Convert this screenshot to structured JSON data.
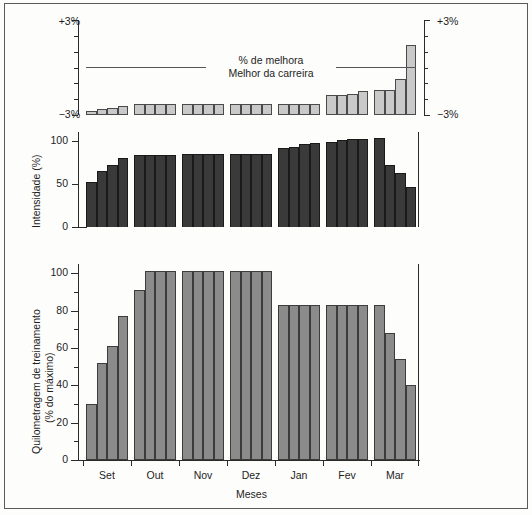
{
  "figure": {
    "background": "#fdfdfc",
    "border_color": "#5a5a5a",
    "xlabel": "Meses",
    "months": [
      "Set",
      "Out",
      "Nov",
      "Dez",
      "Jan",
      "Fev",
      "Mar"
    ]
  },
  "chart_data": [
    {
      "type": "bar",
      "id": "improvement",
      "title": "",
      "annotation_line1": "% de melhora",
      "annotation_line2": "Melhor da carreira",
      "xlabel": "",
      "ylabel": "",
      "ylim": [
        -3,
        3
      ],
      "ytick_labels_left": [
        "+3%",
        "−3%"
      ],
      "ytick_labels_right": [
        "+3%",
        "−3%"
      ],
      "grid": false,
      "reference_line_value": 0,
      "bar_color": "#c9c9c9",
      "bar_edge_color": "#4a4a4a",
      "categories": [
        "Set",
        "Out",
        "Nov",
        "Dez",
        "Jan",
        "Fev",
        "Mar"
      ],
      "x": [
        "Set-1",
        "Set-2",
        "Set-3",
        "Set-4",
        "Out-1",
        "Out-2",
        "Out-3",
        "Out-4",
        "Nov-1",
        "Nov-2",
        "Nov-3",
        "Nov-4",
        "Dez-1",
        "Dez-2",
        "Dez-3",
        "Dez-4",
        "Jan-1",
        "Jan-2",
        "Jan-3",
        "Jan-4",
        "Fev-1",
        "Fev-2",
        "Fev-3",
        "Fev-4",
        "Mar-1",
        "Mar-2",
        "Mar-3",
        "Mar-4"
      ],
      "values": [
        -2.75,
        -2.65,
        -2.55,
        -2.4,
        -2.3,
        -2.3,
        -2.3,
        -2.3,
        -2.3,
        -2.3,
        -2.3,
        -2.3,
        -2.3,
        -2.3,
        -2.3,
        -2.3,
        -2.3,
        -2.3,
        -2.3,
        -2.3,
        -1.75,
        -1.75,
        -1.7,
        -1.5,
        -1.45,
        -1.45,
        -0.7,
        1.4
      ]
    },
    {
      "type": "bar",
      "id": "intensity",
      "title": "",
      "xlabel": "",
      "ylabel": "Intensidade (%)",
      "ylim": [
        0,
        110
      ],
      "ytick_values": [
        0,
        50,
        100
      ],
      "ytick_labels": [
        "0",
        "50",
        "100"
      ],
      "grid": false,
      "bar_color": "#3a3a3a",
      "bar_edge_color": "#1a1a1a",
      "categories": [
        "Set",
        "Out",
        "Nov",
        "Dez",
        "Jan",
        "Fev",
        "Mar"
      ],
      "x": [
        "Set-1",
        "Set-2",
        "Set-3",
        "Set-4",
        "Out-1",
        "Out-2",
        "Out-3",
        "Out-4",
        "Nov-1",
        "Nov-2",
        "Nov-3",
        "Nov-4",
        "Dez-1",
        "Dez-2",
        "Dez-3",
        "Dez-4",
        "Jan-1",
        "Jan-2",
        "Jan-3",
        "Jan-4",
        "Fev-1",
        "Fev-2",
        "Fev-3",
        "Fev-4",
        "Mar-1",
        "Mar-2",
        "Mar-3",
        "Mar-4"
      ],
      "values": [
        52,
        65,
        72,
        80,
        83,
        83,
        83,
        83,
        84,
        84,
        84,
        84,
        84,
        84,
        84,
        84,
        91,
        93,
        96,
        97,
        98,
        101,
        102,
        102,
        103,
        72,
        63,
        46
      ]
    },
    {
      "type": "bar",
      "id": "mileage",
      "title": "",
      "xlabel": "Meses",
      "ylabel": "Quilometragem de treinamento (% do máximo)",
      "ylim": [
        0,
        105
      ],
      "ytick_values": [
        0,
        20,
        40,
        60,
        80,
        100
      ],
      "ytick_labels": [
        "0",
        "20",
        "40",
        "60",
        "80",
        "100"
      ],
      "grid": false,
      "bar_color": "#8b8b8b",
      "bar_edge_color": "#3c3c3c",
      "categories": [
        "Set",
        "Out",
        "Nov",
        "Dez",
        "Jan",
        "Fev",
        "Mar"
      ],
      "x": [
        "Set-1",
        "Set-2",
        "Set-3",
        "Set-4",
        "Out-1",
        "Out-2",
        "Out-3",
        "Out-4",
        "Nov-1",
        "Nov-2",
        "Nov-3",
        "Nov-4",
        "Dez-1",
        "Dez-2",
        "Dez-3",
        "Dez-4",
        "Jan-1",
        "Jan-2",
        "Jan-3",
        "Jan-4",
        "Fev-1",
        "Fev-2",
        "Fev-3",
        "Fev-4",
        "Mar-1",
        "Mar-2",
        "Mar-3",
        "Mar-4"
      ],
      "values": [
        30,
        52,
        61,
        77,
        91,
        101,
        101,
        101,
        101,
        101,
        101,
        101,
        101,
        101,
        101,
        101,
        83,
        83,
        83,
        83,
        83,
        83,
        83,
        83,
        83,
        68,
        54,
        40
      ]
    }
  ]
}
